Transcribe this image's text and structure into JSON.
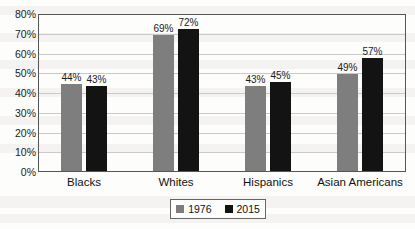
{
  "chart_data": {
    "type": "bar",
    "title": "",
    "xlabel": "",
    "ylabel": "",
    "ylim": [
      0,
      80
    ],
    "ytick_labels": [
      "80%",
      "70%",
      "60%",
      "50%",
      "40%",
      "30%",
      "20%",
      "10%",
      "0%"
    ],
    "ytick_values": [
      80,
      70,
      60,
      50,
      40,
      30,
      20,
      10,
      0
    ],
    "grid": true,
    "legend_position": "bottom",
    "categories": [
      "Blacks",
      "Whites",
      "Hispanics",
      "Asian Americans"
    ],
    "series": [
      {
        "name": "1976",
        "color": "#7e7e7e",
        "values": [
          44,
          69,
          43,
          49
        ],
        "value_labels": [
          "44%",
          "69%",
          "43%",
          "49%"
        ]
      },
      {
        "name": "2015",
        "color": "#131313",
        "values": [
          43,
          72,
          45,
          57
        ],
        "value_labels": [
          "43%",
          "72%",
          "45%",
          "57%"
        ]
      }
    ]
  },
  "legend": {
    "items": [
      {
        "label": "1976",
        "color": "#7e7e7e"
      },
      {
        "label": "2015",
        "color": "#131313"
      }
    ]
  }
}
